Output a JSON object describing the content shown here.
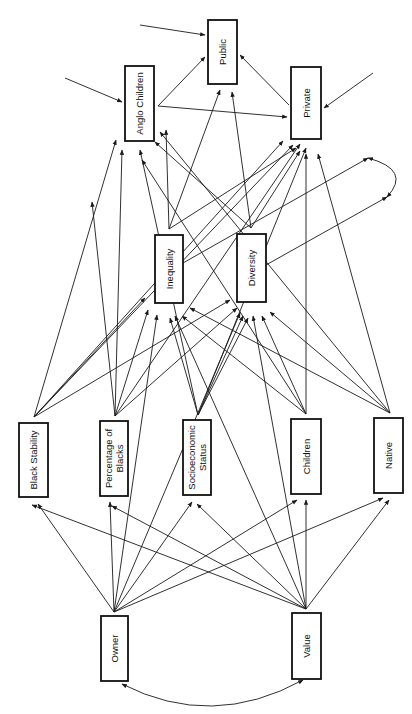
{
  "diagram": {
    "type": "path-diagram",
    "nodes": [
      {
        "id": "public",
        "label": "Public",
        "lines": [
          "Public"
        ],
        "x": 208,
        "y": 20,
        "w": 29,
        "h": 64
      },
      {
        "id": "anglo_children",
        "label": "Anglo Children",
        "lines": [
          "Anglo  Children"
        ],
        "x": 125,
        "y": 66,
        "w": 29,
        "h": 75
      },
      {
        "id": "private",
        "label": "Private",
        "lines": [
          "Private"
        ],
        "x": 291,
        "y": 67,
        "w": 30,
        "h": 72
      },
      {
        "id": "inequality",
        "label": "Inequality",
        "lines": [
          "Inequality"
        ],
        "x": 155,
        "y": 235,
        "w": 28,
        "h": 68
      },
      {
        "id": "diversity",
        "label": "Diversity",
        "lines": [
          "Diversity"
        ],
        "x": 237,
        "y": 234,
        "w": 29,
        "h": 68
      },
      {
        "id": "black_stability",
        "label": "Black Stability",
        "lines": [
          "Black Stability"
        ],
        "x": 19,
        "y": 423,
        "w": 29,
        "h": 74
      },
      {
        "id": "percentage_blacks",
        "label": "Percentage of Blacks",
        "lines": [
          "Percentage of",
          "Blacks"
        ],
        "x": 100,
        "y": 421,
        "w": 28,
        "h": 75
      },
      {
        "id": "ses",
        "label": "Socioeconomic Status",
        "lines": [
          "Socioeconomic",
          "Status"
        ],
        "x": 183,
        "y": 420,
        "w": 28,
        "h": 75
      },
      {
        "id": "children",
        "label": "Children",
        "lines": [
          "Children"
        ],
        "x": 291,
        "y": 419,
        "w": 30,
        "h": 75
      },
      {
        "id": "native",
        "label": "Native",
        "lines": [
          "Native"
        ],
        "x": 374,
        "y": 418,
        "w": 29,
        "h": 75
      },
      {
        "id": "owner",
        "label": "Owner",
        "lines": [
          "Owner"
        ],
        "x": 101,
        "y": 616,
        "w": 27,
        "h": 65
      },
      {
        "id": "value",
        "label": "Value",
        "lines": [
          "Value"
        ],
        "x": 292,
        "y": 613,
        "w": 29,
        "h": 66
      }
    ],
    "edges": [
      {
        "from": [
          140,
          25
        ],
        "to": [
          205,
          35
        ],
        "label": "disturbance-public"
      },
      {
        "from": [
          65,
          78
        ],
        "to": [
          122,
          102
        ],
        "label": "disturbance-anglo"
      },
      {
        "from": [
          373,
          73
        ],
        "to": [
          324,
          108
        ],
        "label": "disturbance-private"
      },
      {
        "from": [
          158,
          106
        ],
        "to": [
          205,
          57
        ],
        "label": "anglo-public"
      },
      {
        "from": [
          158,
          106
        ],
        "to": [
          287,
          117
        ],
        "label": "anglo-private"
      },
      {
        "from": [
          289,
          105
        ],
        "to": [
          240,
          55
        ],
        "label": "private-public"
      },
      {
        "from": [
          169,
          229
        ],
        "to": [
          220,
          90
        ],
        "label": "inequality-public"
      },
      {
        "from": [
          169,
          229
        ],
        "to": [
          166,
          130
        ],
        "label": "inequality-anglo"
      },
      {
        "from": [
          169,
          229
        ],
        "to": [
          296,
          148
        ],
        "label": "inequality-private"
      },
      {
        "from": [
          251,
          228
        ],
        "to": [
          232,
          92
        ],
        "label": "diversity-public"
      },
      {
        "from": [
          251,
          228
        ],
        "to": [
          155,
          142
        ],
        "label": "diversity-anglo"
      },
      {
        "from": [
          251,
          228
        ],
        "to": [
          300,
          151
        ],
        "label": "diversity-private"
      },
      {
        "from": [
          183,
          263
        ],
        "to": [
          368,
          158
        ],
        "label": "inequality-loop"
      },
      {
        "from": [
          266,
          265
        ],
        "to": [
          387,
          197
        ],
        "label": "diversity-loop"
      },
      {
        "from": [
          34,
          417
        ],
        "to": [
          116,
          140
        ],
        "label": "blackstab-anglo"
      },
      {
        "from": [
          34,
          417
        ],
        "to": [
          293,
          145
        ],
        "label": "blackstab-private"
      },
      {
        "from": [
          34,
          417
        ],
        "to": [
          283,
          141
        ],
        "label": "blackstab-private2"
      },
      {
        "from": [
          34,
          417
        ],
        "to": [
          145,
          298
        ],
        "label": "blackstab-inequality"
      },
      {
        "from": [
          34,
          417
        ],
        "to": [
          230,
          300
        ],
        "label": "blackstab-diversity"
      },
      {
        "from": [
          115,
          416
        ],
        "to": [
          122,
          150
        ],
        "label": "pctblacks-anglo"
      },
      {
        "from": [
          115,
          416
        ],
        "to": [
          300,
          144
        ],
        "label": "pctblacks-private"
      },
      {
        "from": [
          115,
          416
        ],
        "to": [
          148,
          310
        ],
        "label": "pctblacks-inequality"
      },
      {
        "from": [
          115,
          416
        ],
        "to": [
          237,
          308
        ],
        "label": "pctblacks-diversity"
      },
      {
        "from": [
          115,
          416
        ],
        "to": [
          92,
          202
        ],
        "label": "pctblacks-up"
      },
      {
        "from": [
          198,
          415
        ],
        "to": [
          170,
          318
        ],
        "label": "ses-inequality"
      },
      {
        "from": [
          198,
          415
        ],
        "to": [
          243,
          316
        ],
        "label": "ses-diversity"
      },
      {
        "from": [
          198,
          415
        ],
        "to": [
          140,
          150
        ],
        "label": "ses-anglo"
      },
      {
        "from": [
          198,
          415
        ],
        "to": [
          306,
          148
        ],
        "label": "ses-private"
      },
      {
        "from": [
          198,
          415
        ],
        "to": [
          248,
          318
        ],
        "label": "ses-diversity2"
      },
      {
        "from": [
          306,
          414
        ],
        "to": [
          142,
          160
        ],
        "label": "children-anglo"
      },
      {
        "from": [
          306,
          414
        ],
        "to": [
          306,
          154
        ],
        "label": "children-private"
      },
      {
        "from": [
          306,
          414
        ],
        "to": [
          182,
          316
        ],
        "label": "children-inequality"
      },
      {
        "from": [
          306,
          414
        ],
        "to": [
          262,
          316
        ],
        "label": "children-diversity"
      },
      {
        "from": [
          390,
          413
        ],
        "to": [
          160,
          132
        ],
        "label": "native-anglo"
      },
      {
        "from": [
          390,
          413
        ],
        "to": [
          318,
          154
        ],
        "label": "native-private"
      },
      {
        "from": [
          390,
          413
        ],
        "to": [
          190,
          308
        ],
        "label": "native-inequality"
      },
      {
        "from": [
          390,
          413
        ],
        "to": [
          270,
          312
        ],
        "label": "native-diversity"
      },
      {
        "from": [
          114,
          612
        ],
        "to": [
          38,
          504
        ],
        "label": "owner-blackstab"
      },
      {
        "from": [
          114,
          612
        ],
        "to": [
          110,
          502
        ],
        "label": "owner-pctblacks"
      },
      {
        "from": [
          114,
          612
        ],
        "to": [
          192,
          502
        ],
        "label": "owner-ses"
      },
      {
        "from": [
          114,
          612
        ],
        "to": [
          297,
          500
        ],
        "label": "owner-children"
      },
      {
        "from": [
          114,
          612
        ],
        "to": [
          383,
          498
        ],
        "label": "owner-native"
      },
      {
        "from": [
          114,
          612
        ],
        "to": [
          157,
          315
        ],
        "label": "owner-inequality"
      },
      {
        "from": [
          114,
          612
        ],
        "to": [
          240,
          313
        ],
        "label": "owner-diversity"
      },
      {
        "from": [
          306,
          609
        ],
        "to": [
          32,
          505
        ],
        "label": "value-blackstab"
      },
      {
        "from": [
          306,
          609
        ],
        "to": [
          112,
          506
        ],
        "label": "value-pctblacks"
      },
      {
        "from": [
          306,
          609
        ],
        "to": [
          197,
          504
        ],
        "label": "value-ses"
      },
      {
        "from": [
          306,
          609
        ],
        "to": [
          306,
          500
        ],
        "label": "value-children"
      },
      {
        "from": [
          306,
          609
        ],
        "to": [
          389,
          500
        ],
        "label": "value-native"
      },
      {
        "from": [
          306,
          609
        ],
        "to": [
          175,
          316
        ],
        "label": "value-inequality"
      },
      {
        "from": [
          306,
          609
        ],
        "to": [
          253,
          316
        ],
        "label": "value-diversity"
      }
    ],
    "curves": [
      {
        "id": "owner-value-correlation",
        "d": "M 122 684 Q 212 730 303 680",
        "arrow_start": true,
        "arrow_end": true
      },
      {
        "id": "inequality-diversity-loop",
        "d": "M 368 158 Q 412 170 387 197",
        "arrow_start": true,
        "arrow_end": true
      }
    ]
  }
}
